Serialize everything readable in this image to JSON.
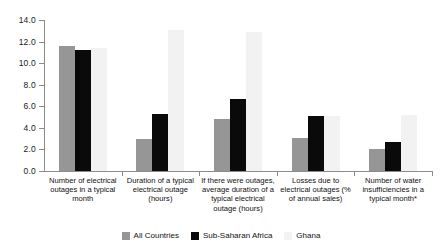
{
  "chart_data": {
    "type": "bar",
    "title": "",
    "subtitle": "",
    "xlabel": "",
    "ylabel": "",
    "ylim": [
      0.0,
      14.0
    ],
    "ytick_labels": [
      "0.0",
      "2.0",
      "4.0",
      "6.0",
      "8.0",
      "10.0",
      "12.0",
      "14.0"
    ],
    "ytick_values": [
      0,
      2,
      4,
      6,
      8,
      10,
      12,
      14
    ],
    "grid": false,
    "legend_position": "bottom",
    "categories": [
      "Number of electrical outages in a typical month",
      "Duration of a typical electrical outage (hours)",
      "If there were outages, average duration of a typical electrical outage (hours)",
      "Losses due to electrical outages (% of annual sales)",
      "Number of water insufficiencies in a typical month*"
    ],
    "series": [
      {
        "name": "All Countries",
        "color": "#969696",
        "values": [
          11.6,
          3.0,
          4.8,
          3.1,
          2.0
        ]
      },
      {
        "name": "Sub-Saharan Africa",
        "color": "#0a0a0a",
        "values": [
          11.2,
          5.3,
          6.7,
          5.1,
          2.7
        ]
      },
      {
        "name": "Ghana",
        "color": "#f2f2f2",
        "values": [
          11.4,
          13.1,
          12.9,
          5.1,
          5.2
        ]
      }
    ]
  }
}
